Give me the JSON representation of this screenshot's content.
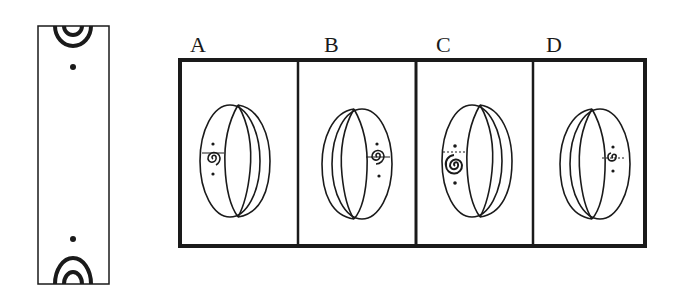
{
  "puzzle": {
    "type": "spatial-folding",
    "question_strip": {
      "description": "flat strip with concentric half-circle arcs and dots at both ends",
      "top_pattern": "double-arc-with-dot",
      "bottom_pattern": "double-arc-with-dot"
    },
    "options": [
      {
        "label": "A",
        "ring_opening": "right",
        "spiral_side": "left",
        "spiral_size": "medium",
        "seam": "solid"
      },
      {
        "label": "B",
        "ring_opening": "left",
        "spiral_side": "right",
        "spiral_size": "medium",
        "seam": "solid"
      },
      {
        "label": "C",
        "ring_opening": "right",
        "spiral_side": "left",
        "spiral_size": "large",
        "seam": "dashed"
      },
      {
        "label": "D",
        "ring_opening": "left",
        "spiral_side": "right",
        "spiral_size": "small",
        "seam": "dashed"
      }
    ]
  },
  "colors": {
    "ink": "#1a1a1a",
    "background": "#ffffff"
  }
}
